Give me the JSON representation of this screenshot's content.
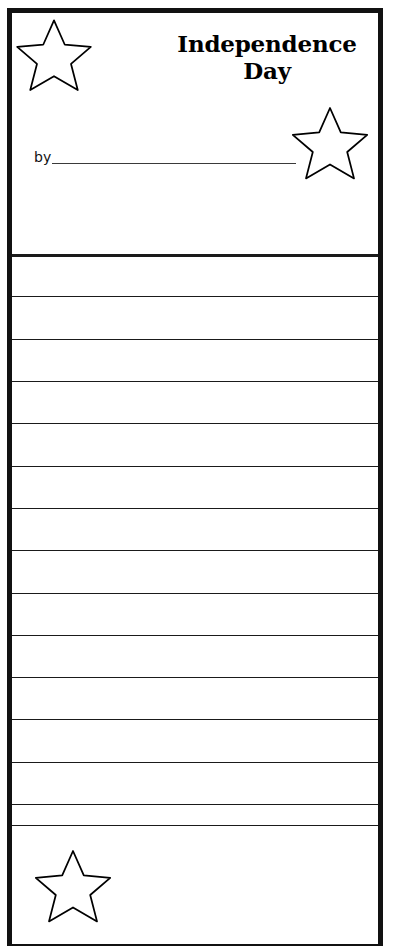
{
  "page": {
    "doc_type": "printable-writing-worksheet",
    "title_line_1": "Independence",
    "title_line_2": "Day",
    "byline_label": "by",
    "byline_value": "",
    "ink_color": "#000000",
    "paper_color": "#ffffff",
    "width_px": 394,
    "height_px": 951
  },
  "header": {
    "title": "Independence Day",
    "title_lines": [
      "Independence",
      "Day"
    ],
    "byline": {
      "label": "by",
      "value": "",
      "placeholder": ""
    }
  },
  "decorations": {
    "stars": [
      {
        "name": "star-top-left",
        "position": "top-left",
        "x": 14,
        "y": 18,
        "width": 80,
        "height": 76,
        "fill": "#ffffff",
        "stroke": "#000000"
      },
      {
        "name": "star-middle-right",
        "position": "middle-right",
        "x": 290,
        "y": 105,
        "width": 80,
        "height": 78,
        "fill": "#ffffff",
        "stroke": "#000000"
      },
      {
        "name": "star-bottom-left",
        "position": "bottom-left",
        "x": 33,
        "y": 848,
        "width": 80,
        "height": 78,
        "fill": "#ffffff",
        "stroke": "#000000"
      }
    ]
  },
  "rules": {
    "count": 15,
    "line_color": "#1a1a1a",
    "first_line_heavy": true,
    "y_positions": [
      254,
      296,
      339,
      381,
      423,
      466,
      508,
      550,
      593,
      635,
      677,
      719,
      762,
      804,
      825
    ],
    "spacing_px": 42.3
  },
  "footer": {
    "has_illustration_area": true,
    "illustration_hint": ""
  }
}
